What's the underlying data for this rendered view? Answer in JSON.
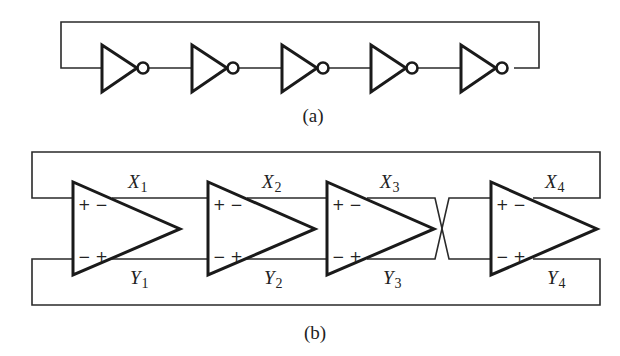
{
  "figure_a": {
    "caption": "(a)",
    "description": "Five-stage single-ended ring oscillator made of inverters",
    "inverter_count": 5
  },
  "figure_b": {
    "caption": "(b)",
    "description": "Four-stage differential ring oscillator with crossed feedback",
    "stages": [
      {
        "x_label": "X",
        "x_sub": "1",
        "y_label": "Y",
        "y_sub": "1",
        "top_polarity": "+ −",
        "bottom_polarity": "− +"
      },
      {
        "x_label": "X",
        "x_sub": "2",
        "y_label": "Y",
        "y_sub": "2",
        "top_polarity": "+ −",
        "bottom_polarity": "− +"
      },
      {
        "x_label": "X",
        "x_sub": "3",
        "y_label": "Y",
        "y_sub": "3",
        "top_polarity": "+ −",
        "bottom_polarity": "− +"
      },
      {
        "x_label": "X",
        "x_sub": "4",
        "y_label": "Y",
        "y_sub": "4",
        "top_polarity": "+ −",
        "bottom_polarity": "− +"
      }
    ]
  }
}
